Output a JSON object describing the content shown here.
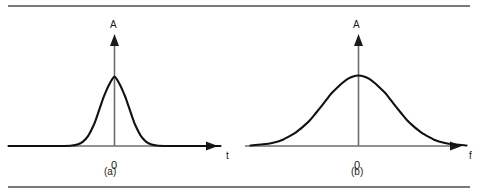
{
  "figure": {
    "background_color": "#ffffff",
    "rule_color": "#7a7a7a",
    "axis_color": "#6e6e6e",
    "curve_color": "#111111",
    "panels": [
      {
        "id": "a",
        "caption": "(a)",
        "y_axis_label": "A",
        "x_axis_label": "t",
        "origin_label": "0"
      },
      {
        "id": "b",
        "caption": "(b)",
        "y_axis_label": "A",
        "x_axis_label": "f",
        "origin_label": "0"
      }
    ]
  },
  "chart_data": [
    {
      "type": "line",
      "title": "",
      "subtitle": "",
      "panel": "(a)",
      "xlabel": "t",
      "ylabel": "A",
      "legend": [],
      "grid": false,
      "xlim": [
        -5,
        5
      ],
      "ylim": [
        0,
        1.15
      ],
      "xticks": [
        0
      ],
      "xticklabels": [
        "0"
      ],
      "yticks": [],
      "yticklabels": [],
      "annotations": [
        "(a)"
      ],
      "description": "Narrow Gaussian pulse in the time domain, centred at t = 0, peak amplitude 1.0, standard deviation 0.40.",
      "series": [
        {
          "name": "narrow gaussian pulse",
          "x": [
            -5.0,
            -4.5,
            -4.0,
            -3.5,
            -3.0,
            -2.5,
            -2.0,
            -1.75,
            -1.5,
            -1.25,
            -1.0,
            -0.875,
            -0.75,
            -0.625,
            -0.5,
            -0.375,
            -0.25,
            -0.125,
            0.0,
            0.125,
            0.25,
            0.375,
            0.5,
            0.625,
            0.75,
            0.875,
            1.0,
            1.25,
            1.5,
            1.75,
            2.0,
            2.5,
            3.0,
            3.5,
            4.0,
            4.5,
            5.0
          ],
          "y": [
            0.0,
            0.0,
            0.0,
            0.0,
            0.0,
            0.0,
            0.007,
            0.022,
            0.059,
            0.141,
            0.287,
            0.383,
            0.493,
            0.606,
            0.712,
            0.804,
            0.884,
            0.952,
            1.0,
            0.952,
            0.884,
            0.804,
            0.712,
            0.606,
            0.493,
            0.383,
            0.287,
            0.141,
            0.059,
            0.022,
            0.007,
            0.0,
            0.0,
            0.0,
            0.0,
            0.0,
            0.0
          ]
        }
      ]
    },
    {
      "type": "line",
      "title": "",
      "subtitle": "",
      "panel": "(b)",
      "xlabel": "f",
      "ylabel": "A",
      "legend": [],
      "grid": false,
      "xlim": [
        -5,
        5
      ],
      "ylim": [
        0,
        1.15
      ],
      "xticks": [
        0
      ],
      "xticklabels": [
        "0"
      ],
      "yticks": [],
      "yticklabels": [],
      "annotations": [
        "(b)"
      ],
      "description": "Broad Gaussian spectrum in the frequency domain, centred at f = 0, peak amplitude 1.0, standard deviation 1.60.",
      "series": [
        {
          "name": "broad gaussian spectrum",
          "x": [
            -5.0,
            -4.5,
            -4.0,
            -3.5,
            -3.0,
            -2.75,
            -2.5,
            -2.25,
            -2.0,
            -1.75,
            -1.5,
            -1.25,
            -1.0,
            -0.75,
            -0.5,
            -0.25,
            0.0,
            0.25,
            0.5,
            0.75,
            1.0,
            1.25,
            1.5,
            1.75,
            2.0,
            2.25,
            2.5,
            2.75,
            3.0,
            3.5,
            4.0,
            4.5,
            5.0
          ],
          "y": [
            0.008,
            0.022,
            0.044,
            0.09,
            0.173,
            0.228,
            0.293,
            0.366,
            0.458,
            0.551,
            0.651,
            0.749,
            0.822,
            0.895,
            0.953,
            0.988,
            1.0,
            0.988,
            0.953,
            0.895,
            0.822,
            0.749,
            0.651,
            0.551,
            0.458,
            0.366,
            0.293,
            0.228,
            0.173,
            0.09,
            0.044,
            0.022,
            0.008
          ]
        }
      ]
    }
  ]
}
